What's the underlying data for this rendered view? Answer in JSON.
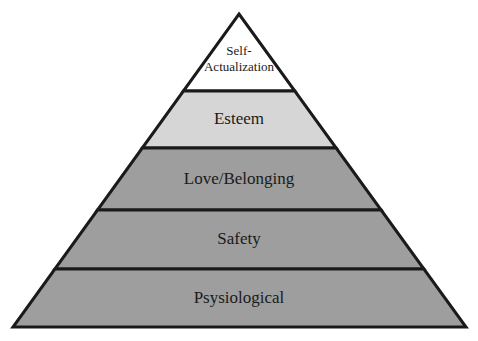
{
  "diagram": {
    "type": "pyramid",
    "background_color": "#ffffff",
    "outline_color": "#1a1a1a",
    "text_color": "#1a1a1a",
    "apex": {
      "x": 239,
      "y": 14
    },
    "base": {
      "left_x": 13,
      "right_x": 466,
      "y": 327
    },
    "divider_y": [
      91,
      148,
      210,
      269
    ],
    "levels": [
      {
        "rank": 5,
        "name": "self-actualization",
        "label_line1": "Self-",
        "label_line2": "Actualization",
        "label_full": "Self-Actualization",
        "fill": "#ffffff",
        "top_y": 14,
        "bottom_y": 91,
        "font_size": 13
      },
      {
        "rank": 4,
        "name": "esteem",
        "label_line1": "Esteem",
        "label_line2": "",
        "label_full": "Esteem",
        "fill": "#d6d6d6",
        "top_y": 91,
        "bottom_y": 148,
        "font_size": 17
      },
      {
        "rank": 3,
        "name": "love-belonging",
        "label_line1": "Love/Belonging",
        "label_line2": "",
        "label_full": "Love/Belonging",
        "fill": "#9e9e9e",
        "top_y": 148,
        "bottom_y": 210,
        "font_size": 17
      },
      {
        "rank": 2,
        "name": "safety",
        "label_line1": "Safety",
        "label_line2": "",
        "label_full": "Safety",
        "fill": "#9e9e9e",
        "top_y": 210,
        "bottom_y": 269,
        "font_size": 17
      },
      {
        "rank": 1,
        "name": "psysiological",
        "label_line1": "Psysiological",
        "label_line2": "",
        "label_full": "Psysiological",
        "fill": "#9e9e9e",
        "top_y": 269,
        "bottom_y": 327,
        "font_size": 17
      }
    ]
  }
}
